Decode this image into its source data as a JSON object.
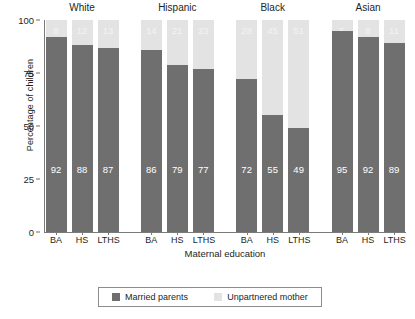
{
  "chart_data": {
    "type": "bar",
    "subtype": "stacked-100-percent-grouped",
    "title": "",
    "xlabel": "Maternal education",
    "ylabel": "Percentage of children",
    "ylim": [
      0,
      100
    ],
    "yticks": [
      0,
      25,
      50,
      75,
      100
    ],
    "grid": false,
    "legend_position": "bottom",
    "categories": [
      "BA",
      "HS",
      "LTHS"
    ],
    "groups": [
      "White",
      "Hispanic",
      "Black",
      "Asian"
    ],
    "series": [
      {
        "name": "Married parents",
        "color": "#6f6f6f",
        "values_by_group": {
          "White": [
            92,
            88,
            87
          ],
          "Hispanic": [
            86,
            79,
            77
          ],
          "Black": [
            72,
            55,
            49
          ],
          "Asian": [
            95,
            92,
            89
          ]
        }
      },
      {
        "name": "Unpartnered mother",
        "color": "#e3e3e3",
        "values_by_group": {
          "White": [
            8,
            12,
            13
          ],
          "Hispanic": [
            14,
            21,
            23
          ],
          "Black": [
            28,
            45,
            51
          ],
          "Asian": [
            5,
            8,
            11
          ]
        }
      }
    ],
    "panels": [
      {
        "group": "White",
        "bars": [
          {
            "category": "BA",
            "married": 92,
            "unpartnered": 8
          },
          {
            "category": "HS",
            "married": 88,
            "unpartnered": 12
          },
          {
            "category": "LTHS",
            "married": 87,
            "unpartnered": 13
          }
        ]
      },
      {
        "group": "Hispanic",
        "bars": [
          {
            "category": "BA",
            "married": 86,
            "unpartnered": 14
          },
          {
            "category": "HS",
            "married": 79,
            "unpartnered": 21
          },
          {
            "category": "LTHS",
            "married": 77,
            "unpartnered": 23
          }
        ]
      },
      {
        "group": "Black",
        "bars": [
          {
            "category": "BA",
            "married": 72,
            "unpartnered": 28
          },
          {
            "category": "HS",
            "married": 55,
            "unpartnered": 45
          },
          {
            "category": "LTHS",
            "married": 49,
            "unpartnered": 51
          }
        ]
      },
      {
        "group": "Asian",
        "bars": [
          {
            "category": "BA",
            "married": 95,
            "unpartnered": 5
          },
          {
            "category": "HS",
            "married": 92,
            "unpartnered": 8
          },
          {
            "category": "LTHS",
            "married": 89,
            "unpartnered": 11
          }
        ]
      }
    ]
  },
  "axes": {
    "y_title": "Percentage of children",
    "x_title": "Maternal education",
    "y_tick_labels": [
      "0",
      "25",
      "50",
      "75",
      "100"
    ]
  },
  "legend": {
    "items": [
      {
        "label": "Married parents",
        "swatch": "married"
      },
      {
        "label": "Unpartnered mother",
        "swatch": "unpartnered"
      }
    ]
  }
}
